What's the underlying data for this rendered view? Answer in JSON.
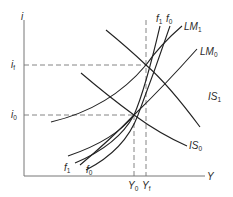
{
  "diagram": {
    "axes": {
      "y_label": "i",
      "x_label": "Y"
    },
    "y_ticks": [
      {
        "id": "if",
        "base": "i",
        "sub": "f"
      },
      {
        "id": "i0",
        "base": "i",
        "sub": "0"
      }
    ],
    "x_ticks": [
      {
        "id": "Y0",
        "base": "Y",
        "sub": "0"
      },
      {
        "id": "Yf",
        "base": "Y",
        "sub": "f"
      }
    ],
    "curves": [
      {
        "id": "LM1",
        "base": "LM",
        "sub": "1"
      },
      {
        "id": "LM0",
        "base": "LM",
        "sub": "0"
      },
      {
        "id": "IS1",
        "base": "IS",
        "sub": "1"
      },
      {
        "id": "IS0",
        "base": "IS",
        "sub": "0"
      },
      {
        "id": "f1_top",
        "base": "f",
        "sub": "1"
      },
      {
        "id": "f0_top",
        "base": "f",
        "sub": "0"
      },
      {
        "id": "f1_bottom",
        "base": "f",
        "sub": "1"
      },
      {
        "id": "f0_bottom",
        "base": "f",
        "sub": "0"
      }
    ],
    "equilibria": [
      {
        "id": "E0",
        "at": [
          "Y0",
          "i0"
        ]
      },
      {
        "id": "Ef",
        "at": [
          "Yf",
          "if"
        ]
      }
    ]
  }
}
